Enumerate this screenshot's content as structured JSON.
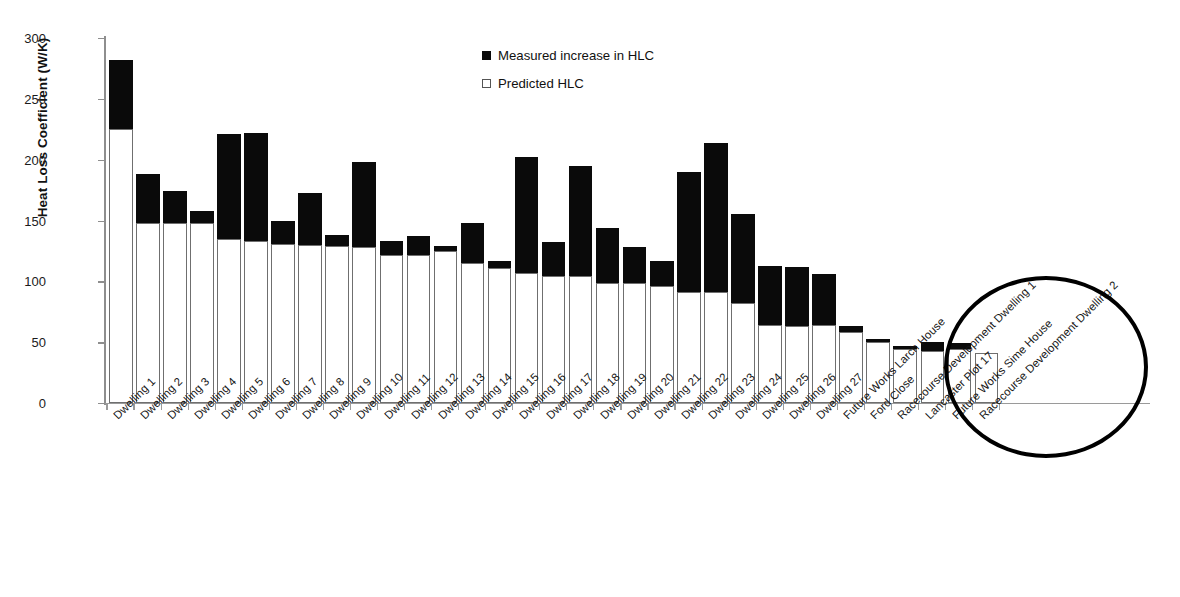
{
  "chart_data": {
    "type": "bar",
    "subtype": "stacked",
    "title": "",
    "xlabel": "",
    "ylabel": "Heat Loss Coefficient (W/K)",
    "ylim": [
      0,
      300
    ],
    "ytick_values": [
      0,
      50,
      100,
      150,
      200,
      250,
      300
    ],
    "ytick_labels": [
      "0",
      "50",
      "100",
      "150",
      "200",
      "250",
      "300"
    ],
    "grid": false,
    "legend_position": "upper-center",
    "legend": [
      {
        "label": "Measured increase in HLC",
        "marker": "filled-square",
        "color": "#0a0a0a"
      },
      {
        "label": "Predicted HLC",
        "marker": "open-square",
        "color": "#ffffff"
      }
    ],
    "categories": [
      "Dwelling 1",
      "Dwelling 2",
      "Dwelling 3",
      "Dwelling 4",
      "Dwelling 5",
      "Dwelling 6",
      "Dwelling 7",
      "Dwelling 8",
      "Dwelling 9",
      "Dwelling 10",
      "Dwelling 11",
      "Dwelling 12",
      "Dwelling 13",
      "Dwelling 14",
      "Dwelling 15",
      "Dwelling 16",
      "Dwelling 17",
      "Dwelling 18",
      "Dwelling 19",
      "Dwelling 20",
      "Dwelling 21",
      "Dwelling 22",
      "Dwelling 23",
      "Dwelling 24",
      "Dwelling 25",
      "Dwelling 26",
      "Dwelling 27",
      "Future Works Larch House",
      "Ford Close",
      "Racecourse Development Dwelling 1",
      "Lancaster Plot 17",
      "Future Works Sime House",
      "Racecourse Development Dwelling 2"
    ],
    "series": [
      {
        "name": "Predicted HLC",
        "values": [
          225,
          148,
          148,
          148,
          135,
          133,
          131,
          130,
          129,
          128,
          122,
          122,
          125,
          115,
          111,
          107,
          104,
          104,
          99,
          99,
          96,
          91,
          91,
          82,
          64,
          63,
          64,
          58,
          50,
          44,
          43,
          44,
          41
        ]
      },
      {
        "name": "Measured increase in HLC",
        "values": [
          57,
          40,
          26,
          10,
          86,
          89,
          19,
          43,
          9,
          70,
          11,
          15,
          4,
          33,
          6,
          95,
          28,
          91,
          45,
          29,
          21,
          99,
          123,
          73,
          49,
          49,
          42,
          5,
          3,
          3,
          7,
          5,
          0
        ]
      }
    ],
    "totals": [
      282,
      188,
      174,
      158,
      221,
      222,
      150,
      173,
      138,
      198,
      133,
      137,
      129,
      148,
      117,
      202,
      132,
      195,
      144,
      128,
      117,
      190,
      214,
      155,
      113,
      112,
      106,
      63,
      53,
      47,
      50,
      49,
      41
    ],
    "annotations": [
      {
        "type": "ellipse",
        "description": "highlight-circle-around-last-six-bars"
      }
    ]
  }
}
